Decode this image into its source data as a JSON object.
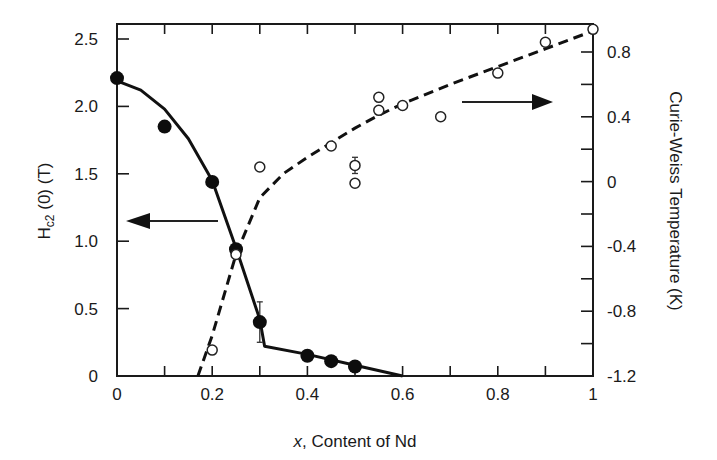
{
  "chart_data": {
    "type": "scatter",
    "title": "",
    "xlabel": "x, Content of Nd",
    "xlabel_italic_part": "x",
    "xlabel_rest": ", Content of Nd",
    "ylabel_left": "Hc2 (0) (T)",
    "ylabel_left_main": "H",
    "ylabel_left_sub": "c2",
    "ylabel_left_rest": " (0) (T)",
    "ylabel_right": "Curie-Weiss Temperature (K)",
    "xlim": [
      0,
      1
    ],
    "ylim_left": [
      0,
      2.5
    ],
    "ylim_right": [
      -1.2,
      0.8
    ],
    "x_ticks": [
      "0",
      "0.2",
      "0.4",
      "0.6",
      "0.8",
      "1"
    ],
    "y_left_ticks": [
      "0",
      "0.5",
      "1.0",
      "1.5",
      "2.0",
      "2.5"
    ],
    "y_right_ticks": [
      "-1.2",
      "-0.8",
      "-0.4",
      "0",
      "0.4",
      "0.8"
    ],
    "grid": false,
    "series": [
      {
        "name": "Hc2(0) (filled circles, left axis)",
        "axis": "left",
        "marker": "filled-circle",
        "points": [
          {
            "x": 0.0,
            "y": 2.21
          },
          {
            "x": 0.1,
            "y": 1.85
          },
          {
            "x": 0.2,
            "y": 1.44
          },
          {
            "x": 0.25,
            "y": 0.94
          },
          {
            "x": 0.3,
            "y": 0.4,
            "err": 0.15
          },
          {
            "x": 0.4,
            "y": 0.15
          },
          {
            "x": 0.45,
            "y": 0.11
          },
          {
            "x": 0.5,
            "y": 0.07
          }
        ]
      },
      {
        "name": "Hc2(0) guide (solid line, left axis)",
        "axis": "left",
        "line": "solid",
        "points": [
          {
            "x": 0.0,
            "y": 2.19
          },
          {
            "x": 0.05,
            "y": 2.12
          },
          {
            "x": 0.1,
            "y": 1.98
          },
          {
            "x": 0.15,
            "y": 1.76
          },
          {
            "x": 0.2,
            "y": 1.45
          },
          {
            "x": 0.25,
            "y": 0.95
          },
          {
            "x": 0.3,
            "y": 0.42
          },
          {
            "x": 0.31,
            "y": 0.22
          },
          {
            "x": 0.4,
            "y": 0.16
          },
          {
            "x": 0.5,
            "y": 0.08
          },
          {
            "x": 0.6,
            "y": 0.0
          }
        ]
      },
      {
        "name": "Curie-Weiss temperature (open circles, right axis)",
        "axis": "right",
        "marker": "open-circle",
        "points": [
          {
            "x": 0.2,
            "y": -1.04
          },
          {
            "x": 0.25,
            "y": -0.45
          },
          {
            "x": 0.3,
            "y": 0.09
          },
          {
            "x": 0.45,
            "y": 0.22
          },
          {
            "x": 0.5,
            "y": 0.1,
            "err": 0.05
          },
          {
            "x": 0.5,
            "y": -0.01
          },
          {
            "x": 0.55,
            "y": 0.52
          },
          {
            "x": 0.55,
            "y": 0.44
          },
          {
            "x": 0.6,
            "y": 0.47
          },
          {
            "x": 0.68,
            "y": 0.4
          },
          {
            "x": 0.8,
            "y": 0.67
          },
          {
            "x": 0.9,
            "y": 0.86
          },
          {
            "x": 1.0,
            "y": 0.94
          }
        ]
      },
      {
        "name": "Curie-Weiss guide (dashed line, right axis)",
        "axis": "right",
        "line": "dashed",
        "points": [
          {
            "x": 0.17,
            "y": -1.2
          },
          {
            "x": 0.2,
            "y": -0.95
          },
          {
            "x": 0.25,
            "y": -0.45
          },
          {
            "x": 0.3,
            "y": -0.1
          },
          {
            "x": 0.35,
            "y": 0.05
          },
          {
            "x": 0.4,
            "y": 0.15
          },
          {
            "x": 0.45,
            "y": 0.24
          },
          {
            "x": 0.5,
            "y": 0.33
          },
          {
            "x": 0.55,
            "y": 0.41
          },
          {
            "x": 0.6,
            "y": 0.48
          },
          {
            "x": 0.7,
            "y": 0.6
          },
          {
            "x": 0.8,
            "y": 0.71
          },
          {
            "x": 0.9,
            "y": 0.82
          },
          {
            "x": 1.0,
            "y": 0.93
          }
        ]
      }
    ],
    "annotations": [
      {
        "type": "arrow",
        "direction": "left",
        "meaning": "filled circles use left axis"
      },
      {
        "type": "arrow",
        "direction": "right",
        "meaning": "open circles use right axis"
      }
    ]
  }
}
